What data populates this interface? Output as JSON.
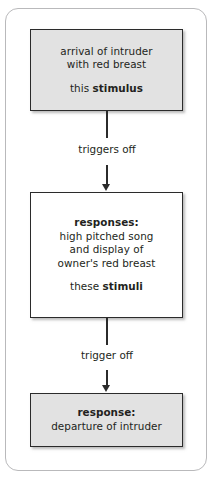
{
  "diagram": {
    "type": "flowchart",
    "orientation": "vertical",
    "frame": {
      "border_color": "#b9b9bb",
      "background": "#ffffff"
    },
    "nodes": [
      {
        "id": "stimulus",
        "fill": "#e2e2e2",
        "border_color": "#2b2b2b",
        "lines": [
          {
            "text": "arrival of intruder",
            "bold": false
          },
          {
            "text": "with red breast",
            "bold": false
          }
        ],
        "label_prefix": "this ",
        "label_bold": "stimulus"
      },
      {
        "id": "responses",
        "fill": "#ffffff",
        "border_color": "#2b2b2b",
        "heading": "responses:",
        "lines": [
          {
            "text": "high pitched song",
            "bold": false
          },
          {
            "text": "and display of",
            "bold": false
          },
          {
            "text": "owner's red breast",
            "bold": false
          }
        ],
        "label_prefix": "these ",
        "label_bold": "stimuli"
      },
      {
        "id": "response",
        "fill": "#e2e2e2",
        "border_color": "#2b2b2b",
        "heading": "response:",
        "lines": [
          {
            "text": "departure of intruder",
            "bold": false
          }
        ]
      }
    ],
    "connectors": [
      {
        "id": "triggers-off",
        "label": "triggers off",
        "from": "stimulus",
        "to": "responses"
      },
      {
        "id": "trigger-off",
        "label": "trigger off",
        "from": "responses",
        "to": "response"
      }
    ]
  },
  "text": {
    "node1_line1": "arrival of intruder",
    "node1_line2": "with red breast",
    "node1_label_prefix": "this ",
    "node1_label_bold": "stimulus",
    "connector1_label": "triggers off",
    "node2_heading": "responses:",
    "node2_line1": "high pitched song",
    "node2_line2": "and display of",
    "node2_line3": "owner's red breast",
    "node2_label_prefix": "these ",
    "node2_label_bold": "stimuli",
    "connector2_label": "trigger off",
    "node3_heading": "response:",
    "node3_line1": "departure of intruder"
  }
}
